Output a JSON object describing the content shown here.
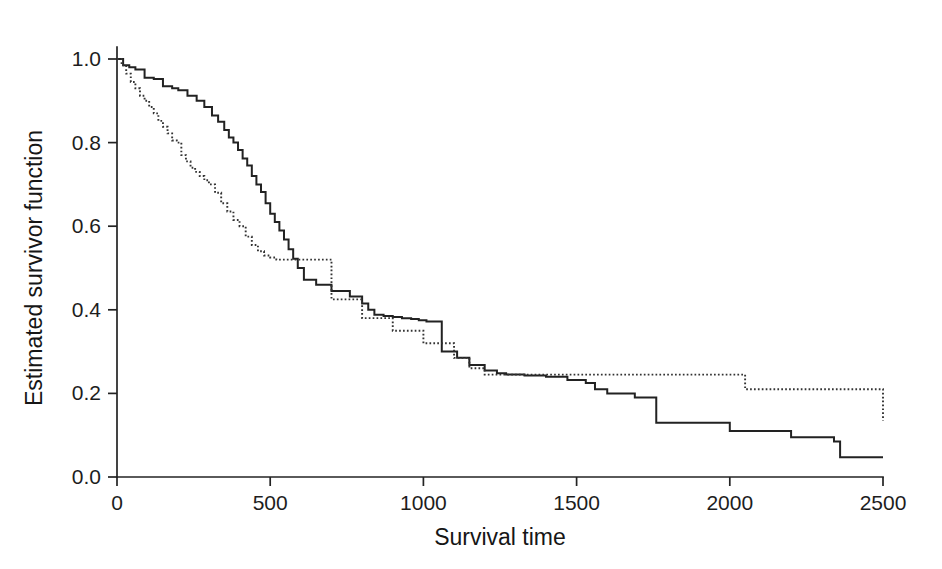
{
  "chart_data": {
    "type": "line",
    "title": "",
    "subtitle": "",
    "xlabel": "Survival time",
    "ylabel": "Estimated survivor function",
    "xlim": [
      0,
      2500
    ],
    "ylim": [
      0.0,
      1.0
    ],
    "xticks": [
      0,
      500,
      1000,
      1500,
      2000,
      2500
    ],
    "xticklabels": [
      "0",
      "500",
      "1000",
      "1500",
      "2000",
      "2500"
    ],
    "yticks": [
      0.0,
      0.2,
      0.4,
      0.6,
      0.8,
      1.0
    ],
    "yticklabels": [
      "0.0",
      "0.2",
      "0.4",
      "0.6",
      "0.8",
      "1.0"
    ],
    "grid": false,
    "legend": "none",
    "plot_style": "kaplan-meier step curves",
    "series": [
      {
        "name": "solid-curve",
        "style": "solid",
        "color": "#222222",
        "step": "post",
        "x": [
          0,
          20,
          40,
          60,
          90,
          120,
          150,
          180,
          200,
          230,
          260,
          285,
          310,
          330,
          350,
          365,
          380,
          395,
          410,
          425,
          440,
          455,
          470,
          485,
          500,
          515,
          530,
          545,
          560,
          575,
          590,
          610,
          650,
          700,
          760,
          800,
          820,
          840,
          870,
          900,
          930,
          960,
          985,
          1010,
          1060,
          1110,
          1150,
          1200,
          1240,
          1270,
          1330,
          1400,
          1470,
          1530,
          1560,
          1600,
          1690,
          1760,
          2000,
          2200,
          2340,
          2360,
          2500
        ],
        "y": [
          1.0,
          0.985,
          0.98,
          0.975,
          0.955,
          0.952,
          0.935,
          0.93,
          0.925,
          0.912,
          0.9,
          0.885,
          0.865,
          0.85,
          0.83,
          0.812,
          0.8,
          0.782,
          0.762,
          0.745,
          0.72,
          0.7,
          0.682,
          0.655,
          0.63,
          0.61,
          0.59,
          0.568,
          0.545,
          0.522,
          0.5,
          0.472,
          0.46,
          0.445,
          0.432,
          0.415,
          0.4,
          0.388,
          0.385,
          0.383,
          0.38,
          0.378,
          0.375,
          0.372,
          0.3,
          0.285,
          0.268,
          0.255,
          0.248,
          0.245,
          0.243,
          0.24,
          0.232,
          0.225,
          0.21,
          0.2,
          0.19,
          0.13,
          0.11,
          0.095,
          0.085,
          0.047,
          0.047
        ],
        "start_value": 1.0,
        "end_value": 0.047,
        "description": "Upper solid Kaplan-Meier curve, better survival early, crosses dotted curve near t=1150"
      },
      {
        "name": "dotted-curve",
        "style": "dotted",
        "color": "#333333",
        "step": "post",
        "x": [
          0,
          15,
          30,
          45,
          60,
          75,
          90,
          105,
          120,
          135,
          150,
          165,
          180,
          195,
          210,
          225,
          240,
          255,
          270,
          285,
          300,
          320,
          340,
          360,
          380,
          400,
          420,
          440,
          460,
          480,
          500,
          520,
          540,
          560,
          580,
          600,
          700,
          800,
          900,
          1000,
          1100,
          1150,
          1200,
          1300,
          1400,
          1480,
          1560,
          1700,
          1900,
          2050,
          2100,
          2300,
          2500
        ],
        "y": [
          1.0,
          0.985,
          0.965,
          0.945,
          0.93,
          0.912,
          0.9,
          0.885,
          0.87,
          0.852,
          0.838,
          0.822,
          0.805,
          0.8,
          0.77,
          0.755,
          0.74,
          0.73,
          0.72,
          0.71,
          0.7,
          0.68,
          0.655,
          0.635,
          0.615,
          0.6,
          0.575,
          0.555,
          0.54,
          0.53,
          0.525,
          0.52,
          0.52,
          0.52,
          0.52,
          0.52,
          0.425,
          0.38,
          0.35,
          0.32,
          0.285,
          0.26,
          0.245,
          0.245,
          0.245,
          0.245,
          0.245,
          0.245,
          0.245,
          0.21,
          0.21,
          0.21,
          0.135
        ],
        "start_value": 1.0,
        "end_value": 0.135,
        "description": "Lower dotted Kaplan-Meier curve, steeper early decline, long flat tail"
      }
    ],
    "notes": {
      "crossing_point_x": 1150,
      "crossing_point_y": 0.245,
      "solid_final": 0.047,
      "dotted_final": 0.135
    }
  },
  "geometry": {
    "plot_left_px": 117,
    "plot_right_px": 883,
    "plot_top_px": 59,
    "plot_bottom_px": 477,
    "x_domain": [
      0,
      2500
    ],
    "y_domain": [
      0.0,
      1.0
    ]
  }
}
